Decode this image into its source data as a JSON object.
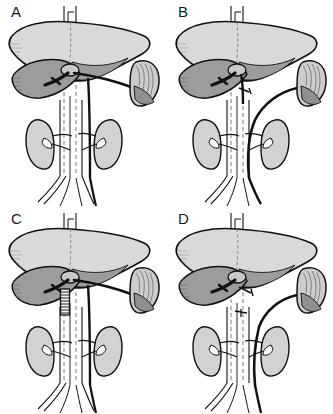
{
  "figure": {
    "type": "medical-illustration",
    "layout": "2x2 grid of anatomical line drawings",
    "background_color": "#ffffff",
    "panel_count": 4
  },
  "palette": {
    "outline": "#111111",
    "vessel_dark": "#0d0d0d",
    "liver_fill": "#d9d9d9",
    "liver_lobe_shadow": "#9c9c9c",
    "spleen_fill": "#cccccc",
    "spleen_shadow": "#8f8f8f",
    "kidney_fill": "#d2d2d2",
    "kidney_shadow": "#a5a5a5",
    "vessel_fill": "#ffffff",
    "dashed_stroke": "#7a7a7a",
    "background": "#ffffff"
  },
  "panels": [
    {
      "id": "A",
      "letter": "A",
      "position": "top-left",
      "shunt_name": "central splenorenal / interposition shunt",
      "description": "Splenic vein carried horizontally from splenic hilum to the portal confluence, with a large vessel descending toward the left renal vein",
      "graft_present": false,
      "graft_type": "none",
      "organs": [
        "liver",
        "spleen",
        "right kidney",
        "left kidney"
      ],
      "vessels": [
        "inferior vena cava",
        "aorta",
        "portal vein",
        "splenic vein",
        "left renal vein",
        "right renal vein",
        "common iliac veins",
        "common iliac arteries"
      ]
    },
    {
      "id": "B",
      "letter": "B",
      "position": "top-right",
      "shunt_name": "distal splenorenal (Warren) shunt",
      "description": "Splenic vein divided and swung inferiorly in a smooth curve to anastomose with the left renal vein; short stump marked at the portal confluence",
      "graft_present": false,
      "graft_type": "none",
      "organs": [
        "liver",
        "spleen",
        "right kidney",
        "left kidney"
      ],
      "vessels": [
        "inferior vena cava",
        "aorta",
        "portal vein",
        "splenic vein",
        "left renal vein",
        "right renal vein",
        "common iliac veins",
        "common iliac arteries"
      ]
    },
    {
      "id": "C",
      "letter": "C",
      "position": "bottom-left",
      "shunt_name": "mesocaval interposition graft shunt",
      "description": "Same layout as panel A with a short vertical ribbed prosthetic conduit placed below the porta hepatis between the portal/mesenteric vein and the vena cava",
      "graft_present": true,
      "graft_type": "ribbed prosthetic interposition graft",
      "graft_location": "below porta hepatis, left of midline vessels",
      "organs": [
        "liver",
        "spleen",
        "right kidney",
        "left kidney"
      ],
      "vessels": [
        "inferior vena cava",
        "aorta",
        "portal vein",
        "splenic vein",
        "left renal vein",
        "right renal vein",
        "common iliac veins",
        "common iliac arteries"
      ]
    },
    {
      "id": "D",
      "letter": "D",
      "position": "bottom-right",
      "shunt_name": "splenorenal shunt with portal vein ligation",
      "description": "Splenic vein curves down to the left renal vein; ligature stumps are marked at the portal confluence and on the superior mesenteric vein below it",
      "graft_present": false,
      "graft_type": "none",
      "ligature_marks": 2,
      "organs": [
        "liver",
        "spleen",
        "right kidney",
        "left kidney"
      ],
      "vessels": [
        "inferior vena cava",
        "aorta",
        "portal vein",
        "splenic vein",
        "superior mesenteric vein",
        "left renal vein",
        "right renal vein",
        "common iliac veins",
        "common iliac arteries"
      ]
    }
  ],
  "organ_labels": {
    "liver": "liver",
    "spleen": "spleen",
    "kidney_left": "left kidney",
    "kidney_right": "right kidney",
    "ivc": "inferior vena cava",
    "aorta": "aorta"
  }
}
